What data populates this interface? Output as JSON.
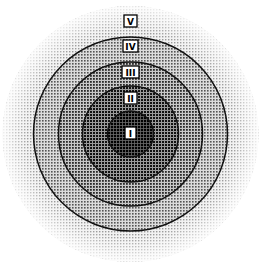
{
  "diagram": {
    "type": "concentric-circles",
    "center": {
      "x": 130.5,
      "y": 134
    },
    "rings": [
      {
        "id": "V",
        "label": "V",
        "radius": 128,
        "shade": "#e4e4e4",
        "dot": "#9a9a9a",
        "label_y": 21
      },
      {
        "id": "IV",
        "label": "IV",
        "radius": 97,
        "shade": "#c4c4c4",
        "dot": "#555555",
        "label_y": 46
      },
      {
        "id": "III",
        "label": "III",
        "radius": 72,
        "shade": "#a2a2a2",
        "dot": "#333333",
        "label_y": 72
      },
      {
        "id": "II",
        "label": "II",
        "radius": 48,
        "shade": "#777777",
        "dot": "#1a1a1a",
        "label_y": 98
      },
      {
        "id": "I",
        "label": "I",
        "radius": 23,
        "shade": "#4a4a4a",
        "dot": "#000000",
        "label_y": 133
      }
    ]
  }
}
